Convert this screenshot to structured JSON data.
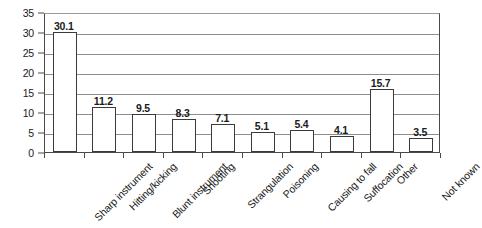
{
  "chart_data": {
    "type": "bar",
    "title": "",
    "xlabel": "",
    "ylabel": "",
    "categories": [
      "Sharp instrument",
      "Hitting/kicking",
      "Blunt instrument",
      "Shooting",
      "Strangulation",
      "Poisoning",
      "Causing to fall",
      "Suffocation",
      "Other",
      "Not known"
    ],
    "values": [
      30.1,
      11.2,
      9.5,
      8.3,
      7.1,
      5.1,
      5.4,
      4.1,
      15.7,
      3.5
    ],
    "value_labels": [
      "30.1",
      "11.2",
      "9.5",
      "8.3",
      "7.1",
      "5.1",
      "5.4",
      "4.1",
      "15.7",
      "3.5"
    ],
    "ylim": [
      0,
      35
    ],
    "ytick_step": 5,
    "ytick_labels": [
      "0",
      "5",
      "10",
      "15",
      "20",
      "25",
      "30",
      "35"
    ],
    "ytick_values": [
      0,
      5,
      10,
      15,
      20,
      25,
      30,
      35
    ],
    "grid": true,
    "legend": false,
    "legend_position": "none",
    "bar_fill_color": "#ffffff",
    "bar_edge_color": "#3a3a3a",
    "gridline_color": "#8d8d8d",
    "axis_color": "#4a4a4a",
    "background_color": "#ffffff",
    "label_rotation_deg": -45
  }
}
